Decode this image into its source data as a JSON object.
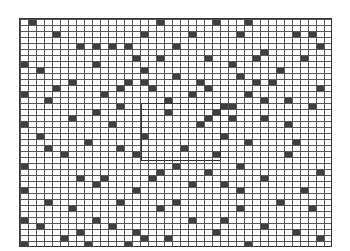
{
  "board": {
    "cols": 39,
    "rows": 38,
    "cell_w": 8,
    "cell_h": 6,
    "grid_color": "#555555",
    "filled_color": "#3f3f3f",
    "filled_cells": [
      [
        1,
        0
      ],
      [
        17,
        0
      ],
      [
        24,
        0
      ],
      [
        28,
        0
      ],
      [
        4,
        2
      ],
      [
        15,
        2
      ],
      [
        21,
        2
      ],
      [
        27,
        2
      ],
      [
        34,
        2
      ],
      [
        36,
        2
      ],
      [
        7,
        4
      ],
      [
        9,
        4
      ],
      [
        11,
        4
      ],
      [
        13,
        4
      ],
      [
        19,
        4
      ],
      [
        37,
        4
      ],
      [
        30,
        5
      ],
      [
        14,
        6
      ],
      [
        17,
        6
      ],
      [
        23,
        6
      ],
      [
        29,
        6
      ],
      [
        35,
        6
      ],
      [
        0,
        7
      ],
      [
        9,
        7
      ],
      [
        26,
        7
      ],
      [
        2,
        8
      ],
      [
        15,
        8
      ],
      [
        32,
        8
      ],
      [
        19,
        9
      ],
      [
        27,
        9
      ],
      [
        6,
        10
      ],
      [
        13,
        10
      ],
      [
        15,
        10
      ],
      [
        22,
        10
      ],
      [
        29,
        10
      ],
      [
        31,
        10
      ],
      [
        4,
        11
      ],
      [
        12,
        11
      ],
      [
        16,
        11
      ],
      [
        23,
        11
      ],
      [
        37,
        11
      ],
      [
        0,
        12
      ],
      [
        10,
        12
      ],
      [
        21,
        12
      ],
      [
        28,
        12
      ],
      [
        3,
        13
      ],
      [
        18,
        13
      ],
      [
        30,
        13
      ],
      [
        33,
        13
      ],
      [
        12,
        14
      ],
      [
        25,
        14
      ],
      [
        26,
        14
      ],
      [
        36,
        14
      ],
      [
        9,
        15
      ],
      [
        18,
        15
      ],
      [
        24,
        15
      ],
      [
        6,
        16
      ],
      [
        23,
        16
      ],
      [
        26,
        16
      ],
      [
        30,
        16
      ],
      [
        0,
        17
      ],
      [
        11,
        17
      ],
      [
        22,
        17
      ],
      [
        33,
        17
      ],
      [
        2,
        19
      ],
      [
        15,
        19
      ],
      [
        25,
        19
      ],
      [
        8,
        20
      ],
      [
        28,
        20
      ],
      [
        34,
        20
      ],
      [
        3,
        21
      ],
      [
        12,
        21
      ],
      [
        20,
        21
      ],
      [
        5,
        22
      ],
      [
        14,
        22
      ],
      [
        24,
        22
      ],
      [
        33,
        22
      ],
      [
        0,
        24
      ],
      [
        19,
        24
      ],
      [
        27,
        24
      ],
      [
        17,
        25
      ],
      [
        23,
        25
      ],
      [
        37,
        25
      ],
      [
        7,
        26
      ],
      [
        10,
        26
      ],
      [
        16,
        26
      ],
      [
        30,
        26
      ],
      [
        9,
        27
      ],
      [
        21,
        27
      ],
      [
        25,
        27
      ],
      [
        0,
        28
      ],
      [
        14,
        28
      ],
      [
        27,
        28
      ],
      [
        35,
        28
      ],
      [
        3,
        30
      ],
      [
        12,
        30
      ],
      [
        19,
        30
      ],
      [
        32,
        30
      ],
      [
        6,
        31
      ],
      [
        17,
        31
      ],
      [
        27,
        31
      ],
      [
        36,
        31
      ],
      [
        0,
        33
      ],
      [
        9,
        33
      ],
      [
        21,
        33
      ],
      [
        25,
        33
      ],
      [
        2,
        34
      ],
      [
        11,
        34
      ],
      [
        30,
        34
      ],
      [
        7,
        35
      ],
      [
        14,
        35
      ],
      [
        24,
        35
      ],
      [
        34,
        35
      ],
      [
        5,
        36
      ],
      [
        15,
        36
      ],
      [
        18,
        36
      ],
      [
        37,
        36
      ],
      [
        0,
        37
      ],
      [
        8,
        37
      ],
      [
        13,
        37
      ],
      [
        28,
        37
      ]
    ]
  },
  "selection": {
    "col": 15,
    "row": 14,
    "cols": 10,
    "rows": 10
  }
}
